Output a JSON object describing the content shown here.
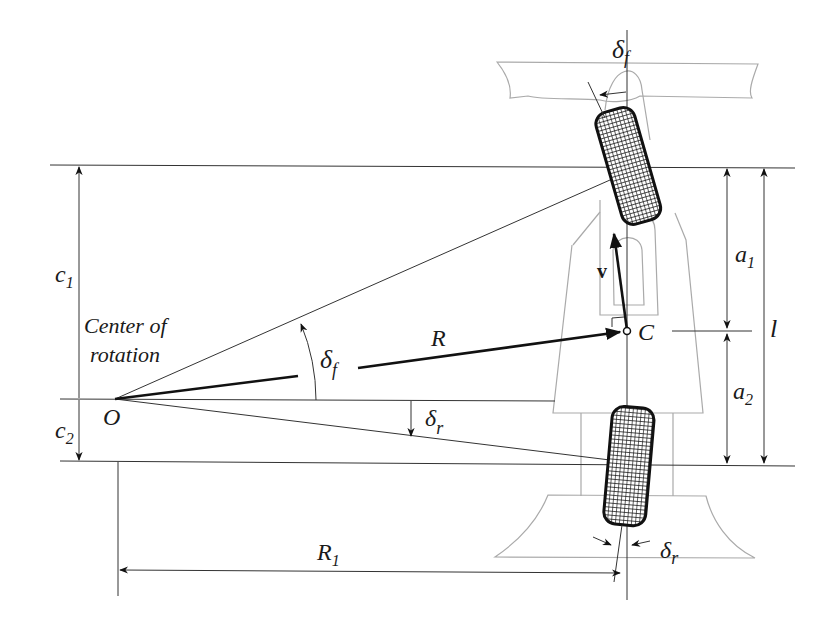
{
  "diagram": {
    "labels": {
      "center_of_rotation_line1": "Center of",
      "center_of_rotation_line2": "rotation",
      "point_O": "O",
      "point_C": "C",
      "radius_R": "R",
      "radius_R1": "R",
      "radius_R1_sub": "1",
      "velocity_v": "v",
      "delta_f_top": "δ",
      "delta_f_top_sub": "f",
      "delta_f_mid": "δ",
      "delta_f_mid_sub": "f",
      "delta_r_mid": "δ",
      "delta_r_mid_sub": "r",
      "delta_r_bottom": "δ",
      "delta_r_bottom_sub": "r",
      "c1": "c",
      "c1_sub": "1",
      "c2": "c",
      "c2_sub": "2",
      "a1": "a",
      "a1_sub": "1",
      "a2": "a",
      "a2_sub": "2",
      "l": "l"
    },
    "colors": {
      "line": "#333333",
      "vector": "#111111",
      "body_outline": "#aaaaaa",
      "tire": "#111111"
    }
  }
}
